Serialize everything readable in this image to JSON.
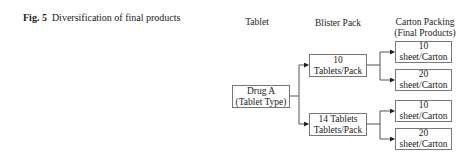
{
  "caption": {
    "label": "Fig. 5",
    "text": "Diversification of final products"
  },
  "headers": {
    "tablet": "Tablet",
    "blister": "Blister Pack",
    "carton_line1": "Carton Packing",
    "carton_line2": "(Final Products)"
  },
  "nodes": {
    "drug": {
      "line1": "Drug A",
      "line2": "(Tablet Type)"
    },
    "blister_10": {
      "line1": "10",
      "line2": "Tablets/Pack"
    },
    "blister_14": {
      "line1": "14 Tablets",
      "line2": "Tablets/Pack"
    },
    "carton_1": {
      "line1": "10",
      "line2": "sheet/Carton"
    },
    "carton_2": {
      "line1": "20",
      "line2": "sheet/Carton"
    },
    "carton_3": {
      "line1": "10",
      "line2": "sheet/Carton"
    },
    "carton_4": {
      "line1": "20",
      "line2": "sheet/Carton"
    }
  }
}
